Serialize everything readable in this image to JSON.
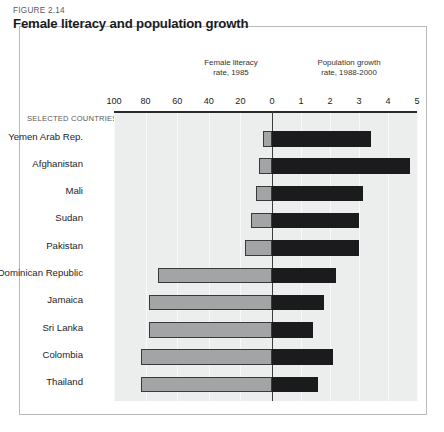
{
  "figure": {
    "number": "FIGURE 2.14",
    "title": "Female literacy and population growth",
    "selected_countries_label": "SELECTED COUNTRIES"
  },
  "panels": {
    "left": {
      "line1": "Female literacy",
      "line2": "rate, 1985"
    },
    "right": {
      "line1": "Population growth",
      "line2": "rate, 1988-2000"
    }
  },
  "chart_data": {
    "type": "bar",
    "orientation": "horizontal",
    "style": "bidirectional-pyramid",
    "title": "Female literacy and population growth",
    "subtitle": "FIGURE 2.14",
    "categories": [
      "Yemen  Arab Rep.",
      "Afghanistan",
      "Mali",
      "Sudan",
      "Pakistan",
      "Dominican Republic",
      "Jamaica",
      "Sri Lanka",
      "Colombia",
      "Thailand"
    ],
    "series": [
      {
        "name": "Female literacy rate, 1985",
        "axis": "left",
        "xlabel": "Female literacy rate, 1985",
        "ticks": [
          100,
          80,
          60,
          40,
          20,
          0
        ],
        "xlim": [
          100,
          0
        ],
        "color": "#a3a4a6",
        "values": [
          6,
          8,
          10,
          13,
          17,
          72,
          78,
          78,
          83,
          83
        ]
      },
      {
        "name": "Population growth rate, 1988-2000",
        "axis": "right",
        "xlabel": "Population growth rate, 1988-2000",
        "ticks": [
          0,
          1,
          2,
          3,
          4,
          5
        ],
        "xlim": [
          0,
          5
        ],
        "color": "#1b1b1d",
        "values": [
          3.4,
          4.75,
          3.15,
          3.0,
          3.0,
          2.2,
          1.8,
          1.4,
          2.1,
          1.6
        ]
      }
    ],
    "axis_ticks_all": [
      "100",
      "80",
      "60",
      "40",
      "20",
      "0",
      "1",
      "2",
      "3",
      "4",
      "5"
    ],
    "grid": true,
    "legend": "none"
  },
  "colors": {
    "literacy_bar": "#a3a4a6",
    "growth_bar": "#1b1b1d",
    "plot_background": "#eceded",
    "gridline": "#f8f9f9",
    "frame": "#b9babc",
    "axis": "#2a2a2c"
  }
}
